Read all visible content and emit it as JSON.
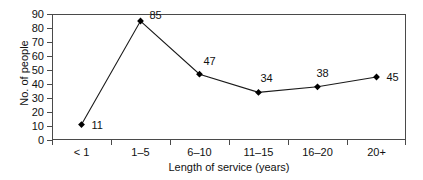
{
  "chart_data": {
    "type": "line",
    "title": "",
    "xlabel": "Length of service (years)",
    "ylabel": "No. of people",
    "categories": [
      "< 1",
      "1–5",
      "6–10",
      "11–15",
      "16–20",
      "20+"
    ],
    "values": [
      11,
      85,
      47,
      34,
      38,
      45
    ],
    "point_labels": [
      "11",
      "85",
      "47",
      "34",
      "38",
      "45"
    ],
    "ylim": [
      0,
      90
    ],
    "ytick_step": 10,
    "ytick_labels": [
      "0",
      "10",
      "20",
      "30",
      "40",
      "50",
      "60",
      "70",
      "80",
      "90"
    ],
    "grid": false,
    "legend": "none",
    "marker": "diamond",
    "line_color": "#1a1a1a",
    "marker_color": "#000000",
    "axis_color": "#4a4a4a",
    "text_color": "#111111",
    "background": "#ffffff"
  }
}
